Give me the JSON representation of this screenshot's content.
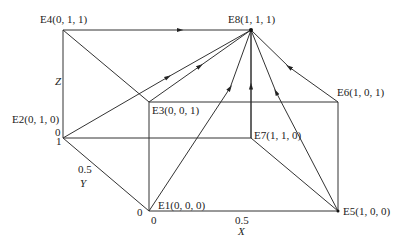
{
  "diagram": {
    "nodes": [
      {
        "id": "E1",
        "label": "E1(0, 0, 0)",
        "x": 149,
        "y": 211
      },
      {
        "id": "E2",
        "label": "E2(0, 1, 0)",
        "x": 63,
        "y": 138
      },
      {
        "id": "E3",
        "label": "E3(0, 0, 1)",
        "x": 149,
        "y": 102
      },
      {
        "id": "E4",
        "label": "E4(0, 1, 1)",
        "x": 63,
        "y": 30
      },
      {
        "id": "E5",
        "label": "E5(1, 0, 0)",
        "x": 338,
        "y": 211
      },
      {
        "id": "E6",
        "label": "E6(1, 0, 1)",
        "x": 338,
        "y": 102
      },
      {
        "id": "E7",
        "label": "E7(1, 1, 0)",
        "x": 251,
        "y": 138
      },
      {
        "id": "E8",
        "label": "E8(1, 1, 1)",
        "x": 251,
        "y": 30
      }
    ],
    "edges_to_E8": [
      "E1",
      "E2",
      "E3",
      "E4",
      "E5",
      "E6",
      "E7"
    ],
    "axes": {
      "x": {
        "label": "X",
        "ticks": [
          "0",
          "0.5"
        ]
      },
      "y": {
        "label": "Y",
        "ticks": [
          "0",
          "0.5",
          "1"
        ]
      },
      "z": {
        "label": "Z",
        "ticks": [
          "0"
        ]
      }
    },
    "labels": {
      "E1": "E1(0, 0, 0)",
      "E2": "E2(0, 1, 0)",
      "E3": "E3(0, 0, 1)",
      "E4": "E4(0, 1, 1)",
      "E5": "E5(1, 0, 0)",
      "E6": "E6(1, 0, 1)",
      "E7": "E7(1, 1, 0)",
      "E8": "E8(1, 1, 1)",
      "axis_x": "X",
      "axis_y": "Y",
      "axis_z": "Z",
      "tick_x0": "0",
      "tick_x05": "0.5",
      "tick_y0": "0",
      "tick_y05": "0.5",
      "tick_y1": "1",
      "tick_z0": "0"
    }
  }
}
